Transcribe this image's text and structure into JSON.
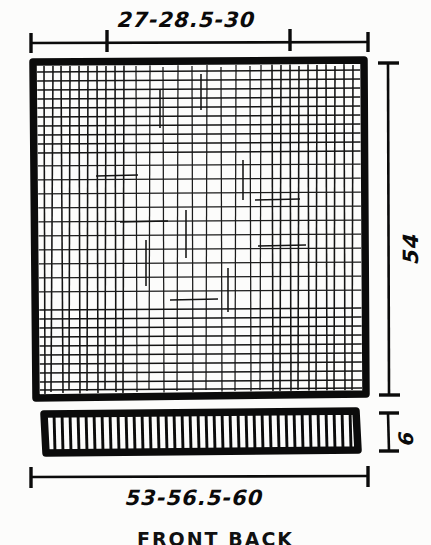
{
  "drawing": {
    "title_caption": "FRONT BACK",
    "dimensions": {
      "top": {
        "label": "27-28.5-30",
        "name": "top-width-dimension",
        "values": [
          27,
          28.5,
          30
        ],
        "unit": "cm",
        "orientation": "horizontal",
        "position": "above-main-panel"
      },
      "bottom": {
        "label": "53-56.5-60",
        "name": "bottom-width-dimension",
        "values": [
          53,
          56.5,
          60
        ],
        "unit": "cm",
        "orientation": "horizontal",
        "position": "below-waistband-strip"
      },
      "right_height": {
        "label": "54",
        "name": "panel-height-dimension",
        "values": [
          54
        ],
        "unit": "cm",
        "orientation": "vertical",
        "position": "right-of-main-panel"
      },
      "strip_height": {
        "label": "6",
        "name": "strip-height-dimension",
        "values": [
          6
        ],
        "unit": "cm",
        "orientation": "vertical",
        "position": "right-of-waistband-strip"
      }
    },
    "shapes": {
      "main_panel": {
        "name": "main-fabric-panel",
        "fill": "cross-hatch",
        "border": "heavy-outline"
      },
      "strip": {
        "name": "waistband-strip",
        "fill": "vertical-hatch",
        "border": "heavy-outline"
      }
    },
    "colors": {
      "ink": "#0b0b0b",
      "paper": "#fcfcfb"
    }
  }
}
